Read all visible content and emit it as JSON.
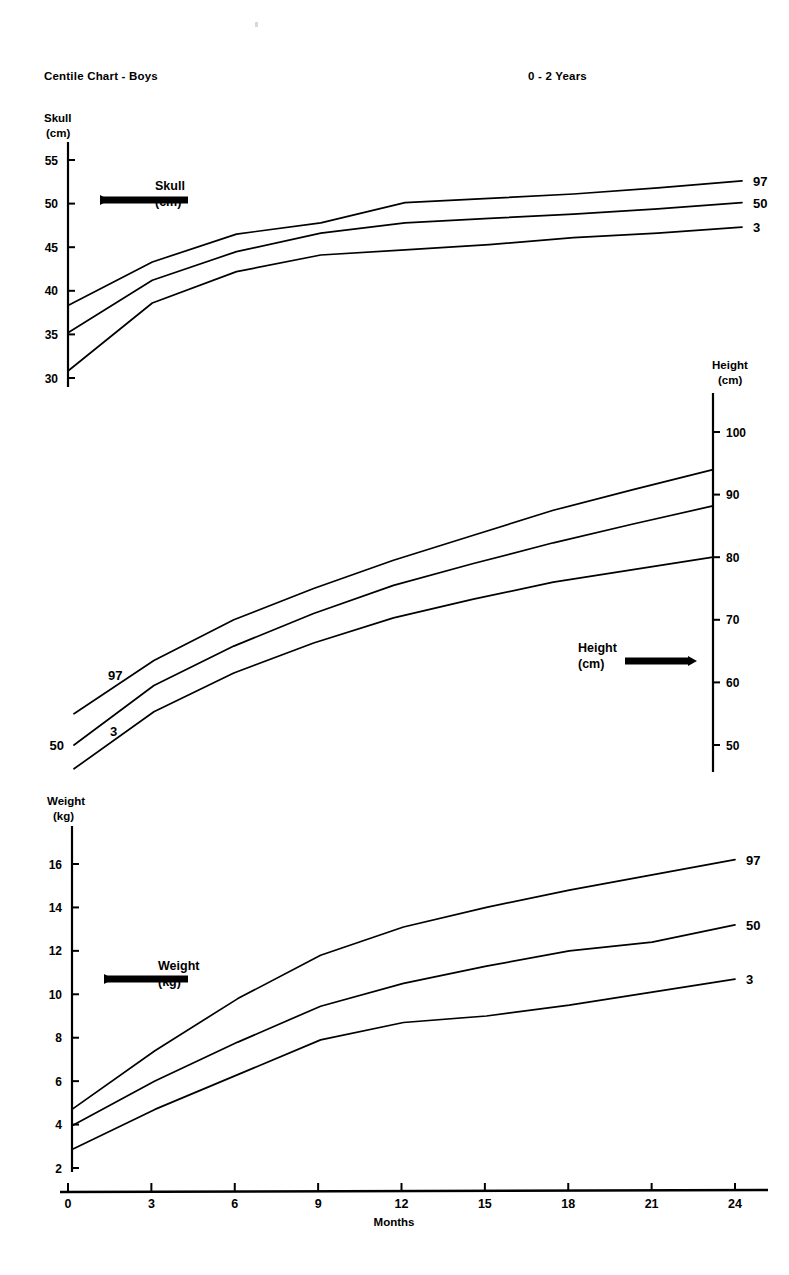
{
  "header": {
    "title": "Centile Chart - Boys",
    "age_range": "0 - 2 Years"
  },
  "x_axis": {
    "label": "Months",
    "ticks": [
      0,
      3,
      6,
      9,
      12,
      15,
      18,
      21,
      24
    ],
    "min": 0,
    "max": 24
  },
  "panels": {
    "skull": {
      "axis_title_line1": "Skull",
      "axis_title_line2": "(cm)",
      "arrow_label_line1": "Skull",
      "arrow_label_line2": "(cm)",
      "arrow_direction": "left",
      "axis_side": "left",
      "unit": "cm",
      "ticks": [
        30,
        35,
        40,
        45,
        50,
        55
      ],
      "label_97": "97",
      "label_50": "50",
      "label_3": "3"
    },
    "height": {
      "axis_title_line1": "Height",
      "axis_title_line2": "(cm)",
      "arrow_label_line1": "Height",
      "arrow_label_line2": "(cm)",
      "arrow_direction": "right",
      "axis_side": "right",
      "unit": "cm",
      "ticks": [
        50,
        60,
        70,
        80,
        90,
        100
      ],
      "label_97": "97",
      "label_50": "50",
      "label_3": "3"
    },
    "weight": {
      "axis_title_line1": "Weight",
      "axis_title_line2": "(kg)",
      "arrow_label_line1": "Weight",
      "arrow_label_line2": "(kg)",
      "arrow_direction": "left",
      "axis_side": "left",
      "unit": "kg",
      "ticks": [
        2,
        4,
        6,
        8,
        10,
        12,
        14,
        16
      ],
      "label_97": "97",
      "label_50": "50",
      "label_3": "3"
    }
  },
  "colors": {
    "ink": "#000000",
    "paper": "#ffffff"
  },
  "chart_data": [
    {
      "type": "line",
      "title": "Skull",
      "xlabel": "Months",
      "ylabel": "Skull (cm)",
      "x": [
        0,
        3,
        6,
        9,
        12,
        15,
        18,
        21,
        24
      ],
      "xlim": [
        0,
        24
      ],
      "ylim": [
        28,
        57
      ],
      "grid": false,
      "legend": "right-of-line-ends",
      "series": [
        {
          "name": "97",
          "values": [
            38.3,
            43.3,
            46.5,
            47.8,
            50.1,
            50.6,
            51.1,
            51.8,
            52.6
          ]
        },
        {
          "name": "50",
          "values": [
            35.2,
            41.2,
            44.5,
            46.6,
            47.8,
            48.3,
            48.8,
            49.4,
            50.1
          ]
        },
        {
          "name": "3",
          "values": [
            30.8,
            38.6,
            42.2,
            44.1,
            44.7,
            45.3,
            46.1,
            46.6,
            47.3
          ]
        }
      ]
    },
    {
      "type": "line",
      "title": "Height",
      "xlabel": "Months",
      "ylabel": "Height (cm)",
      "x": [
        0,
        3,
        6,
        9,
        12,
        15,
        18,
        21,
        24
      ],
      "xlim": [
        0,
        24
      ],
      "ylim": [
        44,
        104
      ],
      "grid": false,
      "legend": "left-of-line-starts",
      "series": [
        {
          "name": "97",
          "values": [
            55.0,
            63.5,
            70.0,
            75.0,
            79.5,
            83.5,
            87.5,
            90.8,
            94.0
          ]
        },
        {
          "name": "50",
          "values": [
            50.0,
            59.5,
            65.8,
            71.0,
            75.5,
            79.0,
            82.3,
            85.3,
            88.2
          ]
        },
        {
          "name": "3",
          "values": [
            46.2,
            55.3,
            61.5,
            66.3,
            70.3,
            73.3,
            76.0,
            78.0,
            80.0
          ]
        }
      ]
    },
    {
      "type": "line",
      "title": "Weight",
      "xlabel": "Months",
      "ylabel": "Weight (kg)",
      "x": [
        0,
        3,
        6,
        9,
        12,
        15,
        18,
        21,
        24
      ],
      "xlim": [
        0,
        24
      ],
      "ylim": [
        1.5,
        17.5
      ],
      "grid": false,
      "legend": "right-of-line-ends",
      "series": [
        {
          "name": "97",
          "values": [
            4.7,
            7.4,
            9.8,
            11.8,
            13.1,
            14.0,
            14.8,
            15.5,
            16.2
          ]
        },
        {
          "name": "50",
          "values": [
            3.95,
            6.0,
            7.8,
            9.45,
            10.5,
            11.3,
            12.0,
            12.4,
            13.2
          ]
        },
        {
          "name": "3",
          "values": [
            2.85,
            4.7,
            6.3,
            7.9,
            8.7,
            9.0,
            9.5,
            10.1,
            10.7
          ]
        }
      ]
    }
  ]
}
